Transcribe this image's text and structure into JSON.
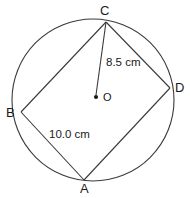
{
  "figure": {
    "background_color": "#ffffff",
    "stroke_color": "#3a3a3a",
    "text_color": "#1a1a1a",
    "circle": {
      "center_x": 93,
      "center_y": 100,
      "radius_px": 81
    },
    "center_point": {
      "name": "O",
      "label": "O",
      "x": 96,
      "y": 97,
      "dot_radius_px": 2
    },
    "vertices": [
      {
        "name": "C",
        "label": "C",
        "x": 106,
        "y": 22
      },
      {
        "name": "D",
        "label": "D",
        "x": 170,
        "y": 88
      },
      {
        "name": "A",
        "label": "A",
        "x": 84,
        "y": 180
      },
      {
        "name": "B",
        "label": "B",
        "x": 21,
        "y": 112
      }
    ],
    "edges": [
      {
        "name": "edge-B-C",
        "from": "B",
        "to": "C"
      },
      {
        "name": "edge-C-D",
        "from": "C",
        "to": "D"
      },
      {
        "name": "edge-D-A",
        "from": "D",
        "to": "A"
      },
      {
        "name": "edge-A-B",
        "from": "A",
        "to": "B"
      }
    ],
    "radius_segment": {
      "name": "segment-C-O",
      "from": "C",
      "to": "O",
      "label": "8.5 cm",
      "value": 8.5,
      "unit": "cm"
    },
    "chord_segment": {
      "name": "segment-A-B",
      "from": "A",
      "to": "B",
      "label": "10.0 cm",
      "value": 10.0,
      "unit": "cm"
    }
  }
}
